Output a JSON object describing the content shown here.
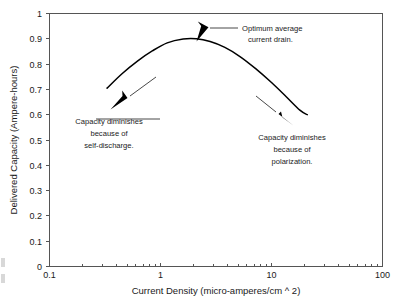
{
  "chart_data": {
    "type": "line",
    "title": "",
    "xlabel": "Current Density (micro-amperes/cm ^ 2)",
    "ylabel": "Delivered Capacity (Ampere-hours)",
    "x_scale": "log",
    "y_scale": "linear",
    "xlim": [
      0.1,
      100
    ],
    "ylim": [
      0,
      1
    ],
    "grid": false,
    "legend": "none",
    "x_tick_labels": [
      "0.1",
      "1",
      "10",
      "100"
    ],
    "x_tick_values": [
      0.1,
      1,
      10,
      100
    ],
    "y_tick_labels": [
      "0",
      "0.1",
      "0.2",
      "0.3",
      "0.4",
      "0.5",
      "0.6",
      "0.7",
      "0.8",
      "0.9",
      "1"
    ],
    "y_tick_values": [
      0,
      0.1,
      0.2,
      0.3,
      0.4,
      0.5,
      0.6,
      0.7,
      0.8,
      0.9,
      1
    ],
    "series": [
      {
        "name": "Delivered capacity vs current density",
        "x": [
          0.33,
          0.45,
          0.62,
          0.85,
          1.15,
          1.6,
          2.1,
          2.8,
          3.8,
          5.2,
          7.2,
          10.0,
          13.5,
          18.0,
          21.0
        ],
        "y": [
          0.705,
          0.762,
          0.812,
          0.853,
          0.884,
          0.899,
          0.9,
          0.889,
          0.866,
          0.83,
          0.782,
          0.727,
          0.672,
          0.618,
          0.6
        ]
      }
    ],
    "peak": {
      "x": 2.0,
      "y": 0.9
    },
    "annotations": [
      {
        "id": "optimum",
        "lines": [
          "Optimum average",
          "current drain."
        ],
        "points_to": {
          "x": 2.2,
          "y": 0.9
        }
      },
      {
        "id": "self-discharge",
        "lines": [
          "Capacity diminishes",
          "because of",
          "self-discharge."
        ],
        "points_to": {
          "x": 0.46,
          "y": 0.78
        }
      },
      {
        "id": "polarization",
        "lines": [
          "Capacity diminishes",
          "because of",
          "polarization."
        ],
        "points_to": {
          "x": 13.0,
          "y": 0.69
        }
      }
    ]
  },
  "axes": {
    "x_title": "Current Density (micro-amperes/cm ^ 2)",
    "y_title": "Delivered Capacity (Ampere-hours)",
    "x_ticks": [
      {
        "label": "0.1"
      },
      {
        "label": "1"
      },
      {
        "label": "10"
      },
      {
        "label": "100"
      }
    ],
    "y_ticks": [
      {
        "label": "1"
      },
      {
        "label": "0.9"
      },
      {
        "label": "0.8"
      },
      {
        "label": "0.7"
      },
      {
        "label": "0.6"
      },
      {
        "label": "0.5"
      },
      {
        "label": "0.4"
      },
      {
        "label": "0.3"
      },
      {
        "label": "0.2"
      },
      {
        "label": "0.1"
      },
      {
        "label": "0"
      }
    ]
  },
  "annotations": {
    "optimum": {
      "line1": "Optimum average",
      "line2": "current drain."
    },
    "self_discharge": {
      "line1": "Capacity diminishes",
      "line2": "because of",
      "line3": "self-discharge."
    },
    "polarization": {
      "line1": "Capacity diminishes",
      "line2": "because of",
      "line3": "polarization."
    }
  },
  "colors": {
    "curve": "#000000",
    "frame": "#555555",
    "text": "#1a1a1a",
    "background": "#ffffff"
  }
}
